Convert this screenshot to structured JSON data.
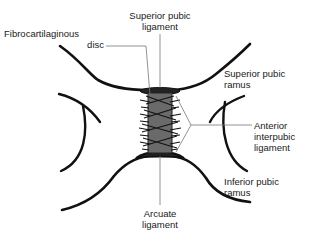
{
  "diagram": {
    "labels": {
      "superior_pubic_ligament": {
        "line1": "Superior pubic",
        "line2": "ligament"
      },
      "fibrocartilaginous_disc": {
        "line1": "Fibrocartilaginous",
        "line2": "disc"
      },
      "superior_pubic_ramus": {
        "line1": "Superior pubic",
        "line2": "ramus"
      },
      "anterior_interpubic_ligament": {
        "line1": "Anterior",
        "line2": "interpubic",
        "line3": "ligament"
      },
      "inferior_pubic_ramus": {
        "line1": "Inferior pubic",
        "line2": "ramus"
      },
      "arcuate_ligament": {
        "line1": "Arcuate",
        "line2": "ligament"
      }
    },
    "colors": {
      "bone_outline": "#111111",
      "leader_line": "#777777",
      "disc_fill": "#6a6a6a",
      "text": "#1a1a1a"
    }
  }
}
